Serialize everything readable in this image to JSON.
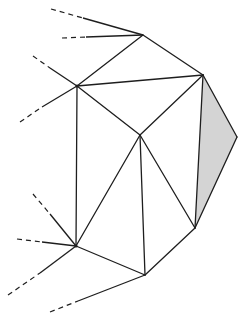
{
  "diagram": {
    "stroke_color": "#1e1e1e",
    "shade_color": "#d4d4d4",
    "vertices": {
      "A": [
        143,
        35
      ],
      "B": [
        203,
        75
      ],
      "C": [
        237,
        137
      ],
      "D": [
        195,
        228
      ],
      "E": [
        145,
        275
      ],
      "F": [
        76,
        246
      ],
      "G": [
        77,
        86
      ],
      "H": [
        140,
        135
      ]
    },
    "edges": [
      [
        "A",
        "B"
      ],
      [
        "B",
        "C"
      ],
      [
        "C",
        "D"
      ],
      [
        "D",
        "E"
      ],
      [
        "E",
        "F"
      ],
      [
        "F",
        "G"
      ],
      [
        "G",
        "A"
      ],
      [
        "G",
        "B"
      ],
      [
        "B",
        "H"
      ],
      [
        "G",
        "H"
      ],
      [
        "H",
        "F"
      ],
      [
        "H",
        "E"
      ],
      [
        "H",
        "D"
      ],
      [
        "B",
        "D"
      ]
    ],
    "shaded_triangle": [
      "B",
      "C",
      "D"
    ],
    "dangling_edges": [
      {
        "to": "A",
        "from": [
          51,
          9
        ],
        "dash_end": [
          83,
          18
        ]
      },
      {
        "to": "A",
        "from": [
          62,
          38
        ],
        "dash_end": [
          86,
          37
        ]
      },
      {
        "to": "G",
        "from": [
          33,
          56
        ],
        "dash_end": [
          50,
          68
        ]
      },
      {
        "to": "G",
        "from": [
          20,
          122
        ],
        "dash_end": [
          42,
          107
        ]
      },
      {
        "to": "F",
        "from": [
          33,
          194
        ],
        "dash_end": [
          50,
          214
        ]
      },
      {
        "to": "F",
        "from": [
          17,
          239
        ],
        "dash_end": [
          42,
          242
        ]
      },
      {
        "to": "F",
        "from": [
          8,
          295
        ],
        "dash_end": [
          40,
          273
        ]
      },
      {
        "to": "E",
        "from": [
          50,
          312
        ],
        "dash_end": [
          78,
          301
        ]
      }
    ]
  }
}
